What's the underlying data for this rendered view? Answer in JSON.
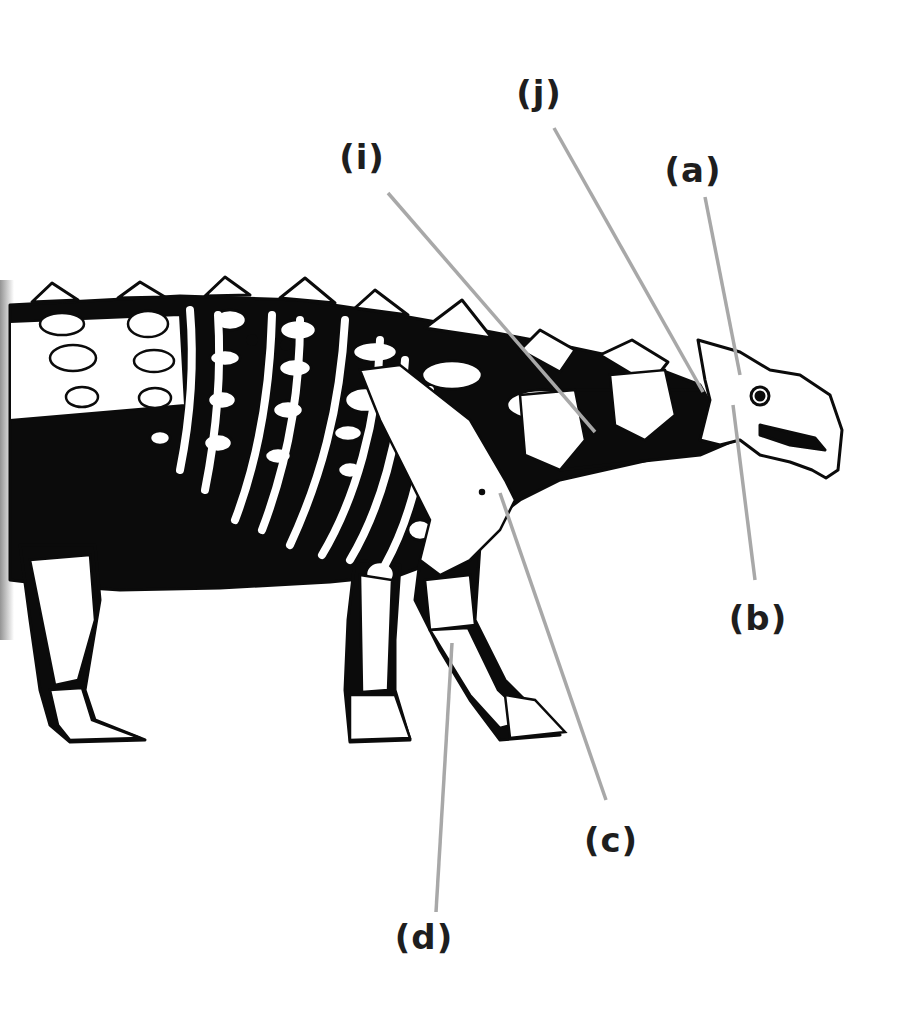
{
  "figure": {
    "colors": {
      "background": "#ffffff",
      "silhouette": "#0b0b0b",
      "bone": "#ffffff",
      "leader_line": "#a8a8a8",
      "label_text": "#1e1e1e"
    }
  },
  "labels": [
    {
      "id": "a",
      "text": "(a)",
      "x": 693,
      "y": 170,
      "line": {
        "x1": 705,
        "y1": 197,
        "x2": 740,
        "y2": 375
      }
    },
    {
      "id": "b",
      "text": "(b)",
      "x": 758,
      "y": 618,
      "line": {
        "x1": 755,
        "y1": 580,
        "x2": 733,
        "y2": 405
      }
    },
    {
      "id": "c",
      "text": "(c)",
      "x": 611,
      "y": 840,
      "line": {
        "x1": 606,
        "y1": 800,
        "x2": 500,
        "y2": 493
      }
    },
    {
      "id": "d",
      "text": "(d)",
      "x": 424,
      "y": 937,
      "line": {
        "x1": 436,
        "y1": 912,
        "x2": 452,
        "y2": 643
      }
    },
    {
      "id": "i",
      "text": "(i)",
      "x": 362,
      "y": 157,
      "line": {
        "x1": 388,
        "y1": 193,
        "x2": 595,
        "y2": 432
      }
    },
    {
      "id": "j",
      "text": "(j)",
      "x": 539,
      "y": 93,
      "line": {
        "x1": 554,
        "y1": 128,
        "x2": 703,
        "y2": 392
      }
    }
  ]
}
